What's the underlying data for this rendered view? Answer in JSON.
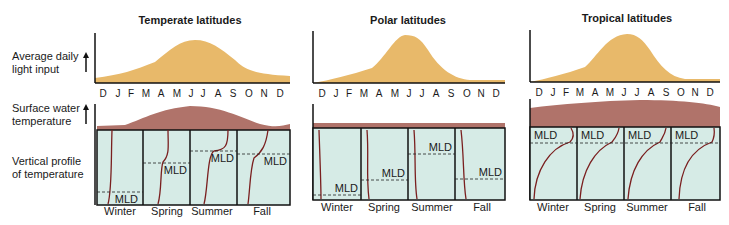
{
  "row_labels": {
    "light": [
      "Average daily",
      "light input"
    ],
    "surface": [
      "Surface water",
      "temperature"
    ],
    "profile": [
      "Vertical profile",
      "of temperature"
    ]
  },
  "months": [
    "D",
    "J",
    "F",
    "M",
    "A",
    "M",
    "J",
    "J",
    "A",
    "S",
    "O",
    "N",
    "D"
  ],
  "seasons": [
    "Winter",
    "Spring",
    "Summer",
    "Fall"
  ],
  "mld_label": "MLD",
  "colors": {
    "light_fill": "#e8b96a",
    "surface_fill": "#b0736a",
    "water_fill": "#d6ebe6",
    "curve": "#7a1f1f",
    "axis": "#111111"
  },
  "panels": [
    {
      "title": "Temperate latitudes",
      "mld_depth_pct": [
        85,
        40,
        18,
        25
      ]
    },
    {
      "title": "Polar latitudes",
      "mld_depth_pct": [
        90,
        60,
        25,
        62
      ]
    },
    {
      "title": "Tropical latitudes",
      "mld_depth_pct": [
        20,
        20,
        20,
        20
      ]
    }
  ]
}
